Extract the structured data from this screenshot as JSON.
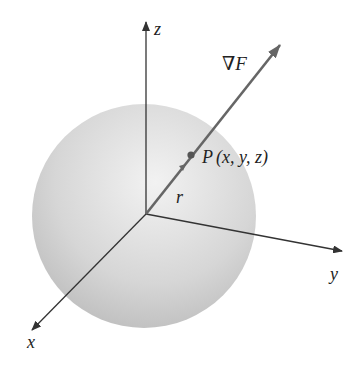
{
  "diagram": {
    "colors": {
      "sphere_light": "#f0f0f0",
      "sphere_dark": "#bdbdbd",
      "axis": "#333333",
      "gradient_vector": "#666666",
      "text": "#222222"
    },
    "axes": {
      "z_label": "z",
      "y_label": "y",
      "x_label": "x"
    },
    "vector": {
      "gradient_label": "∇F",
      "radius_label": "r"
    },
    "point": {
      "name": "P",
      "coords": "(x, y, z)"
    }
  }
}
